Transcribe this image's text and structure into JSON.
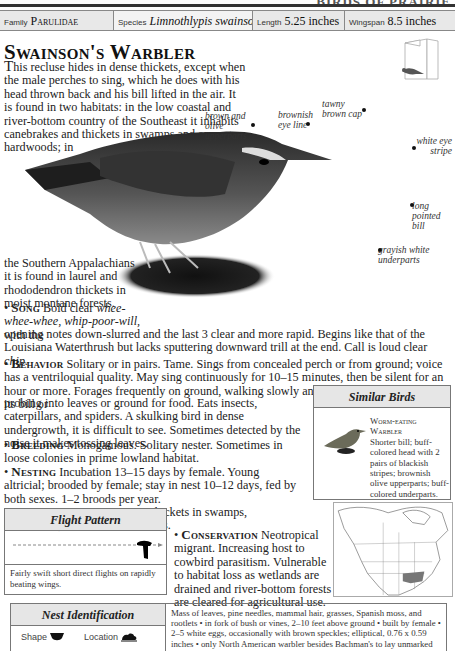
{
  "running_head": "BIRDS OF PRAIRIE",
  "info_bar": {
    "family_label": "Family",
    "family_value": "Parulidae",
    "species_label": "Species",
    "species_value": "Limnothlypis swainsonii",
    "length_label": "Length",
    "length_value": "5.25 inches",
    "wingspan_label": "Wingspan",
    "wingspan_value": "8.5 inches"
  },
  "title": "Swainson's Warbler",
  "intro": {
    "dropcap": "T",
    "text_a": "his recluse hides in dense thickets, except when the male perches to sing, which he does with his head thrown back and his bill lifted in the air. It is found in two habitats: in the low coastal and river-bottom country of the Southeast it inhabits canebrakes and thickets in swamps and among hardwoods; in",
    "text_b": "the Southern Appalachians it is found in laurel and rhododendron thickets in moist montane forests."
  },
  "callouts": {
    "upperparts": "brown and olive upperparts",
    "eye_line": "brownish eye line",
    "cap": "tawny brown cap",
    "eye_stripe": "white eye stripe",
    "bill": "long pointed bill",
    "underparts": "grayish white underparts"
  },
  "sections": {
    "song": {
      "heading": "Song",
      "text_a": "Bold clear ",
      "italic_a": "whee-whee-whee, whip-poor-will,",
      "text_b": " with the",
      "text_c": "opening notes down-slurred and the last 3 clear and more rapid. Begins like that of the Louisiana Waterthrush but lacks sputtering downward trill at the end. Call is loud clear ",
      "italic_b": "chip."
    },
    "behavior": {
      "heading": "Behavior",
      "text_a": "Solitary or in pairs. Tame. Sings from concealed perch or from ground; voice has a ventriloquial quality. May sing continuously for 10–15 minutes, then be silent for an hour or more. Forages frequently on ground, walking slowly and turning over leaves with its bill or",
      "text_b": "probing into leaves or ground for food. Eats insects, caterpillars, and spiders. A skulking bird in dense undergrowth, it is difficult to see. Sometimes detected by the noise it makes tossing leaves."
    },
    "breeding": {
      "heading": "Breeding",
      "text": "Monogamous. Solitary nester. Sometimes in loose colonies in prime lowland habitat."
    },
    "nesting": {
      "heading": "Nesting",
      "text": "Incubation 13–15 days by female. Young altricial; brooded by female; stay in nest 10–12 days, fed by both sexes. 1–2 broods per year."
    },
    "population": {
      "heading": "Population",
      "text": "Uncommon in thickets in swamps, canebrakes, and moist woodlands."
    },
    "conservation": {
      "heading": "Conservation",
      "text": "Neotropical migrant. Increasing host to cowbird parasitism. Vulnerable to habitat loss as wetlands are drained and river-bottom forests are cleared for agricultural use."
    }
  },
  "similar_birds": {
    "heading": "Similar Birds",
    "name_a": "Worm-eating",
    "name_b": "Warbler",
    "desc": "Shorter bill; buff-colored head with 2 pairs of blackish stripes; brownish olive upperparts; buff-colored underparts."
  },
  "flight_pattern": {
    "heading": "Flight Pattern",
    "caption": "Fairly swift short direct flights on rapidly beating wings."
  },
  "nest_identification": {
    "heading": "Nest Identification",
    "shape_label": "Shape",
    "location_label": "Location",
    "description": "Mass of leaves, pine needles, mammal hair, grasses, Spanish moss, and rootlets • in fork of bush or vines, 2–10 feet above ground • built by female • 2–5 white eggs, occasionally with brown speckles; elliptical, 0.76 x 0.59 inches • only North American warbler besides Bachman's to lay unmarked white eggs."
  },
  "colors": {
    "header_bg": "#e8e8e8",
    "border": "#777777",
    "range_fill": "#777777"
  }
}
